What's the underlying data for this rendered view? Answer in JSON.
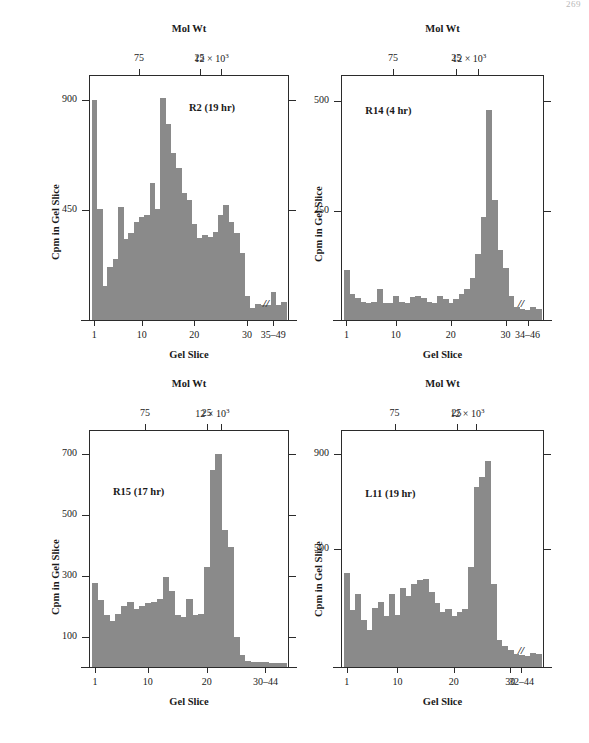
{
  "page": {
    "number": "269"
  },
  "figure": {
    "axis_titles": {
      "top": "Mol Wt",
      "bottom": "Gel Slice",
      "left": "Cpm in Gel Slice"
    },
    "molwt_ticks": [
      "75",
      "25",
      "12 × 10³"
    ],
    "molwt_tick_plain": [
      "75",
      "25",
      "12"
    ],
    "molwt_exponent": "3",
    "molwt_multiplier": "12 × 10"
  },
  "chart_data": [
    {
      "type": "bar",
      "title": "R2 (19 hr)",
      "panel_id": "panel-r2",
      "xlabel": "Gel Slice",
      "ylabel": "Cpm in Gel Slice",
      "top_axis_label": "Mol Wt",
      "top_axis_ticks": [
        {
          "label": "75",
          "slice": 9.5
        },
        {
          "label": "25",
          "slice": 21.0
        },
        {
          "label": "12 × 10³",
          "slice": 25.0
        }
      ],
      "ylim": [
        0,
        1000
      ],
      "yticks": [
        450,
        900
      ],
      "ytick_labels": [
        "450",
        "900"
      ],
      "xlim": [
        0,
        38
      ],
      "xticks": [
        1,
        10,
        20,
        30,
        35
      ],
      "xtick_labels": [
        "1",
        "10",
        "20",
        "30",
        "35–49"
      ],
      "axis_break": true,
      "grid": false,
      "x": [
        1,
        2,
        3,
        4,
        5,
        6,
        7,
        8,
        9,
        10,
        11,
        12,
        13,
        14,
        15,
        16,
        17,
        18,
        19,
        20,
        21,
        22,
        23,
        24,
        25,
        26,
        27,
        28,
        29,
        30,
        31,
        32,
        33,
        34,
        35,
        36,
        37
      ],
      "values": [
        900,
        455,
        140,
        215,
        250,
        460,
        330,
        355,
        400,
        420,
        430,
        560,
        455,
        905,
        800,
        680,
        620,
        520,
        490,
        390,
        335,
        345,
        340,
        360,
        430,
        470,
        400,
        355,
        275,
        100,
        50,
        65,
        60,
        60,
        115,
        60,
        75
      ]
    },
    {
      "type": "bar",
      "title": "R14 (4 hr)",
      "panel_id": "panel-r14",
      "xlabel": "Gel Slice",
      "ylabel": "Cpm in Gel Slice",
      "top_axis_label": "Mol Wt",
      "top_axis_ticks": [
        {
          "label": "75",
          "slice": 9.5
        },
        {
          "label": "25",
          "slice": 21.0
        },
        {
          "label": "12 × 10³",
          "slice": 25.0
        }
      ],
      "ylim": [
        0,
        560
      ],
      "yticks": [
        250,
        500
      ],
      "ytick_labels": [
        "250",
        "500"
      ],
      "xlim": [
        0,
        37
      ],
      "xticks": [
        1,
        10,
        20,
        30,
        34
      ],
      "xtick_labels": [
        "1",
        "10",
        "20",
        "30",
        "34–46"
      ],
      "axis_break": true,
      "grid": false,
      "x": [
        1,
        2,
        3,
        4,
        5,
        6,
        7,
        8,
        9,
        10,
        11,
        12,
        13,
        14,
        15,
        16,
        17,
        18,
        19,
        20,
        21,
        22,
        23,
        24,
        25,
        26,
        27,
        28,
        29,
        30,
        31,
        32,
        33,
        34,
        35,
        36
      ],
      "values": [
        115,
        60,
        50,
        42,
        40,
        42,
        70,
        40,
        38,
        55,
        42,
        40,
        52,
        55,
        50,
        42,
        40,
        55,
        48,
        40,
        48,
        60,
        70,
        95,
        150,
        235,
        480,
        275,
        160,
        120,
        55,
        30,
        25,
        22,
        30,
        25
      ]
    },
    {
      "type": "bar",
      "title": "R15 (17 hr)",
      "panel_id": "panel-r15",
      "xlabel": "Gel Slice",
      "ylabel": "Cpm in Gel Slice",
      "top_axis_label": "Mol Wt",
      "top_axis_ticks": [
        {
          "label": "75",
          "slice": 9.5
        },
        {
          "label": "25",
          "slice": 20.0
        },
        {
          "label": "12 × 10³",
          "slice": 22.5
        }
      ],
      "ylim": [
        0,
        780
      ],
      "yticks": [
        100,
        300,
        500,
        700
      ],
      "ytick_labels": [
        "100",
        "300",
        "500",
        "700"
      ],
      "xlim": [
        0,
        34
      ],
      "xticks": [
        1,
        10,
        20,
        30
      ],
      "xtick_labels": [
        "1",
        "10",
        "20",
        "30–44"
      ],
      "axis_break": false,
      "grid": false,
      "x": [
        1,
        2,
        3,
        4,
        5,
        6,
        7,
        8,
        9,
        10,
        11,
        12,
        13,
        14,
        15,
        16,
        17,
        18,
        19,
        20,
        21,
        22,
        23,
        24,
        25,
        26,
        27,
        28,
        29,
        30,
        31,
        32,
        33
      ],
      "values": [
        275,
        220,
        170,
        150,
        175,
        200,
        215,
        190,
        200,
        210,
        215,
        225,
        295,
        250,
        170,
        165,
        225,
        170,
        175,
        330,
        650,
        700,
        450,
        395,
        100,
        40,
        20,
        18,
        16,
        15,
        14,
        13,
        14
      ]
    },
    {
      "type": "bar",
      "title": "L11 (19 hr)",
      "panel_id": "panel-l11",
      "xlabel": "Gel Slice",
      "ylabel": "Cpm in Gel Slice",
      "top_axis_label": "Mol Wt",
      "top_axis_ticks": [
        {
          "label": "75",
          "slice": 9.5
        },
        {
          "label": "25",
          "slice": 20.5
        },
        {
          "label": "12 × 10³",
          "slice": 24.0
        }
      ],
      "ylim": [
        0,
        1000
      ],
      "yticks": [
        500,
        900
      ],
      "ytick_labels": [
        "500",
        "900"
      ],
      "xlim": [
        0,
        36
      ],
      "xticks": [
        1,
        10,
        20,
        30,
        32
      ],
      "xtick_labels": [
        "1",
        "10",
        "20",
        "30",
        "32–44"
      ],
      "axis_break": true,
      "grid": false,
      "x": [
        1,
        2,
        3,
        4,
        5,
        6,
        7,
        8,
        9,
        10,
        11,
        12,
        13,
        14,
        15,
        16,
        17,
        18,
        19,
        20,
        21,
        22,
        23,
        24,
        25,
        26,
        27,
        28,
        29,
        30,
        31,
        32,
        33,
        34,
        35
      ],
      "values": [
        395,
        240,
        310,
        200,
        155,
        250,
        275,
        215,
        310,
        220,
        335,
        300,
        350,
        365,
        370,
        315,
        270,
        230,
        245,
        215,
        230,
        245,
        420,
        760,
        800,
        870,
        350,
        115,
        90,
        70,
        55,
        50,
        48,
        60,
        55
      ]
    }
  ],
  "colors": {
    "bar_fill": "#8a8a8a",
    "axis": "#2b2b2b",
    "background": "#ffffff",
    "page_number": "#b8b8b8"
  }
}
